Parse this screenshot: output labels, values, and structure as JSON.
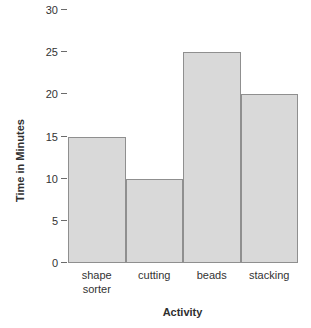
{
  "chart_data": {
    "type": "bar",
    "title": "",
    "subtitle": "",
    "categories": [
      "shape sorter",
      "cutting",
      "beads",
      "stacking"
    ],
    "category_lines": [
      [
        "shape",
        "sorter"
      ],
      [
        "cutting"
      ],
      [
        "beads"
      ],
      [
        "stacking"
      ]
    ],
    "values": [
      15,
      10,
      25,
      20
    ],
    "xlabel": "Activity",
    "ylabel": "Time in Minutes",
    "ylim": [
      0,
      30
    ],
    "yticks": [
      0,
      5,
      10,
      15,
      20,
      25,
      30
    ],
    "ytick_labels": [
      "0",
      "5",
      "10",
      "15",
      "20",
      "25",
      "30"
    ],
    "grid": false,
    "legend": false,
    "legend_position": "none",
    "bar_gap": 0,
    "annotations": []
  },
  "style": {
    "background_color": "#ffffff",
    "bar_fill_color": "#d9d9d9",
    "bar_border_color": "#8f8f8f",
    "text_color": "#333333",
    "axis_title_color": "#2f2f2f",
    "tick_mark_color": "#6b6b6b"
  }
}
